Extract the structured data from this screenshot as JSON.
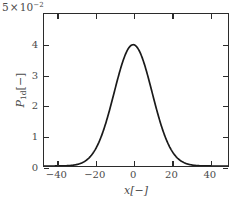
{
  "chart_data": {
    "type": "line",
    "title": "",
    "xlabel": "x[−]",
    "ylabel": "P_1d[−]",
    "offset_label": {
      "mantissa": "5",
      "times": "×",
      "base": "10",
      "exponent": "−2",
      "full": "5 × 10⁻²"
    },
    "xlim": [
      -47,
      50
    ],
    "ylim": [
      0,
      5
    ],
    "xticks": [
      -40,
      -20,
      0,
      20,
      40
    ],
    "xticklabels": [
      "−40",
      "−20",
      "0",
      "20",
      "40"
    ],
    "yticks": [
      0,
      1,
      2,
      3,
      4
    ],
    "yticklabels": [
      "0",
      "1",
      "2",
      "3",
      "4"
    ],
    "grid": false,
    "legend": null,
    "y_scale_factor": 0.01,
    "series": [
      {
        "name": "P_1d",
        "color": "#1a1a1a",
        "linewidth": 1.6,
        "distribution": "gaussian",
        "mean": 0,
        "sigma": 10,
        "peak_value": 3.99,
        "x": [
          -47,
          -45,
          -42,
          -40,
          -38,
          -36,
          -34,
          -32,
          -30,
          -28,
          -26,
          -24,
          -22,
          -20,
          -18,
          -16,
          -14,
          -12,
          -10,
          -8,
          -6,
          -4,
          -2,
          0,
          2,
          4,
          6,
          8,
          10,
          12,
          14,
          16,
          18,
          20,
          22,
          24,
          26,
          28,
          30,
          32,
          34,
          36,
          38,
          40,
          42,
          45,
          50
        ],
        "y": [
          0.0,
          0.0,
          0.01,
          0.03,
          0.06,
          0.1,
          0.18,
          0.3,
          0.44,
          0.63,
          0.86,
          1.13,
          1.43,
          1.76,
          2.1,
          2.44,
          2.76,
          3.05,
          3.3,
          3.51,
          3.69,
          3.84,
          3.95,
          3.99,
          3.95,
          3.84,
          3.69,
          3.51,
          3.3,
          3.05,
          2.76,
          2.44,
          2.1,
          1.76,
          1.43,
          1.13,
          0.86,
          0.63,
          0.44,
          0.3,
          0.18,
          0.1,
          0.06,
          0.03,
          0.01,
          0.0,
          0.0
        ]
      }
    ]
  }
}
